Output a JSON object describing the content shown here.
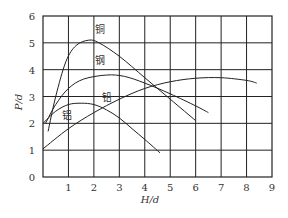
{
  "chart_data": {
    "type": "line",
    "title": "",
    "xlabel": "H/d",
    "ylabel": "P/d",
    "xlim": [
      0,
      9
    ],
    "ylim": [
      0,
      6
    ],
    "grid": true,
    "legend": "inline labels",
    "x_ticks": [
      "1",
      "2",
      "3",
      "4",
      "5",
      "6",
      "7",
      "8",
      "9"
    ],
    "y_ticks": [
      "0",
      "1",
      "2",
      "3",
      "4",
      "5",
      "6"
    ],
    "series": [
      {
        "name": "铜",
        "label_pos": [
          2.05,
          5.35
        ],
        "points": [
          [
            0.2,
            1.7
          ],
          [
            0.5,
            3.0
          ],
          [
            0.9,
            4.3
          ],
          [
            1.3,
            4.9
          ],
          [
            1.8,
            5.1
          ],
          [
            2.2,
            5.0
          ],
          [
            3.0,
            4.5
          ],
          [
            4.0,
            3.7
          ],
          [
            5.0,
            2.9
          ],
          [
            6.0,
            2.1
          ]
        ]
      },
      {
        "name": "钢",
        "label_pos": [
          2.05,
          4.2
        ],
        "points": [
          [
            0.1,
            2.0
          ],
          [
            0.5,
            2.7
          ],
          [
            1.0,
            3.3
          ],
          [
            1.6,
            3.65
          ],
          [
            2.5,
            3.8
          ],
          [
            3.2,
            3.75
          ],
          [
            4.0,
            3.5
          ],
          [
            5.0,
            3.1
          ],
          [
            6.0,
            2.65
          ],
          [
            6.5,
            2.4
          ]
        ]
      },
      {
        "name": "铅",
        "label_pos": [
          2.3,
          2.85
        ],
        "points": [
          [
            0.0,
            2.0
          ],
          [
            0.5,
            2.45
          ],
          [
            1.0,
            2.7
          ],
          [
            1.5,
            2.75
          ],
          [
            2.0,
            2.7
          ],
          [
            2.5,
            2.5
          ],
          [
            3.0,
            2.2
          ],
          [
            3.5,
            1.8
          ],
          [
            4.0,
            1.4
          ],
          [
            4.6,
            0.9
          ]
        ]
      },
      {
        "name": "铝",
        "label_pos": [
          0.75,
          2.15
        ],
        "points": [
          [
            0.0,
            1.05
          ],
          [
            1.0,
            1.8
          ],
          [
            2.0,
            2.4
          ],
          [
            3.0,
            2.9
          ],
          [
            4.0,
            3.3
          ],
          [
            5.0,
            3.55
          ],
          [
            6.0,
            3.68
          ],
          [
            7.0,
            3.7
          ],
          [
            8.0,
            3.6
          ],
          [
            8.4,
            3.5
          ]
        ]
      }
    ]
  }
}
